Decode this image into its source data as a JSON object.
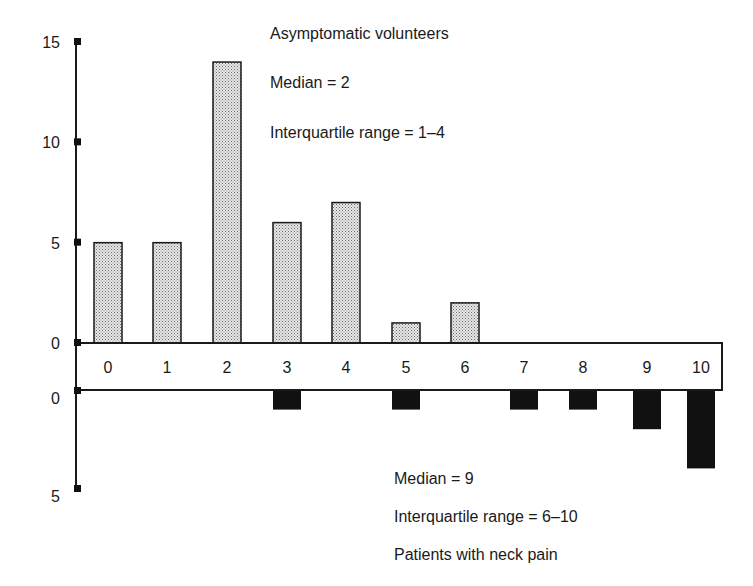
{
  "chart_data": {
    "type": "bar",
    "layout": "mirrored",
    "categories": [
      "0",
      "1",
      "2",
      "3",
      "4",
      "5",
      "6",
      "7",
      "8",
      "9",
      "10"
    ],
    "series": [
      {
        "name": "Asymptomatic volunteers",
        "direction": "up",
        "fill": "stipple-light-gray",
        "values": [
          5,
          5,
          14,
          6,
          7,
          1,
          2,
          0,
          0,
          0,
          0
        ],
        "annotations": [
          "Asymptomatic volunteers",
          "Median = 2",
          "Interquartile range = 1–4"
        ]
      },
      {
        "name": "Patients with neck pain",
        "direction": "down",
        "fill": "#111111",
        "values": [
          0,
          0,
          0,
          1,
          0,
          1,
          0,
          1,
          1,
          2,
          4
        ],
        "annotations": [
          "Median = 9",
          "Interquartile range = 6–10",
          "Patients with neck pain"
        ]
      }
    ],
    "upper_axis": {
      "ylim": [
        0,
        15
      ],
      "ticks": [
        "15",
        "10",
        "5",
        "0"
      ]
    },
    "lower_axis": {
      "ylim": [
        0,
        5
      ],
      "ticks": [
        "0",
        "5"
      ]
    },
    "title": "",
    "xlabel": "",
    "ylabel": "",
    "grid": false,
    "legend": "none"
  },
  "upper_ticks": [
    {
      "label": "15",
      "value": 15
    },
    {
      "label": "10",
      "value": 10
    },
    {
      "label": "5",
      "value": 5
    },
    {
      "label": "0",
      "value": 0
    }
  ],
  "lower_ticks": [
    {
      "label": "0",
      "value": 0
    },
    {
      "label": "5",
      "value": 5
    }
  ],
  "upper_annotations": {
    "group": "Asymptomatic volunteers",
    "median": "Median = 2",
    "iqr": "Interquartile range = 1–4"
  },
  "lower_annotations": {
    "median": "Median = 9",
    "iqr": "Interquartile range = 6–10",
    "group": "Patients with neck pain"
  }
}
